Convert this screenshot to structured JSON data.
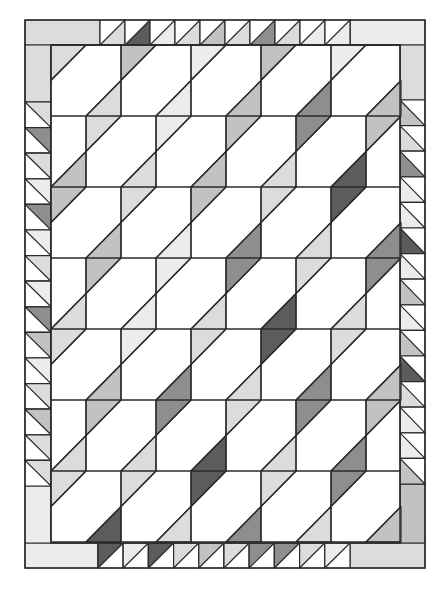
{
  "palette": [
    "#ffffff",
    "#ececec",
    "#dcdcdc",
    "#c2c2c2",
    "#8e8e8e",
    "#5c5c5c"
  ],
  "line_color": "#2a2a2a",
  "frame": {
    "x0": 25,
    "y0": 20,
    "x1": 425,
    "y1": 568,
    "border": 26
  },
  "inner": {
    "x0": 51,
    "y0": 45,
    "x1": 400,
    "y1": 543,
    "block": 70,
    "row_height": 71,
    "rows": 7
  },
  "top_border": {
    "solid_shade": 2,
    "start_x": 100,
    "cell": 25,
    "shaded_half": "lower-right",
    "cells": [
      2,
      5,
      1,
      2,
      3,
      2,
      4,
      2,
      1,
      1
    ],
    "right_solid_shade": 1
  },
  "bottom_border": {
    "solid_shade": 1,
    "start_x": 98,
    "cell": 25.2,
    "shaded_half": "upper-left",
    "cells": [
      5,
      1,
      5,
      2,
      3,
      2,
      4,
      4,
      2,
      1
    ],
    "right_solid_shade": 2
  },
  "left_border": {
    "top_solid_shade": 2,
    "top_solid_end": 102,
    "cell": 25.6,
    "shaded_half": "upper-right",
    "cells": [
      2,
      4,
      2,
      1,
      4,
      1,
      2,
      1,
      4,
      3,
      1,
      2,
      3,
      2,
      2
    ],
    "bottom_solid_shade": 1
  },
  "right_border": {
    "top_solid_shade": 2,
    "top_solid_end": 100,
    "cell": 25.6,
    "shaded_half": "lower-left",
    "cells": [
      3,
      2,
      4,
      1,
      1,
      5,
      1,
      3,
      1,
      3,
      5,
      2,
      1,
      1,
      3
    ],
    "bottom_solid_shade": 3
  },
  "blocks": {
    "top_triangles": [
      2,
      3,
      1,
      3,
      1
    ],
    "row_lower_shades": [
      [
        2,
        1,
        3,
        4,
        3
      ],
      [
        3,
        2,
        3,
        2,
        5
      ],
      [
        3,
        1,
        4,
        2,
        4
      ],
      [
        2,
        1,
        2,
        5,
        2
      ],
      [
        3,
        4,
        2,
        4,
        3
      ],
      [
        2,
        2,
        5,
        2,
        4
      ],
      [
        5,
        2,
        4,
        2,
        3
      ]
    ]
  }
}
